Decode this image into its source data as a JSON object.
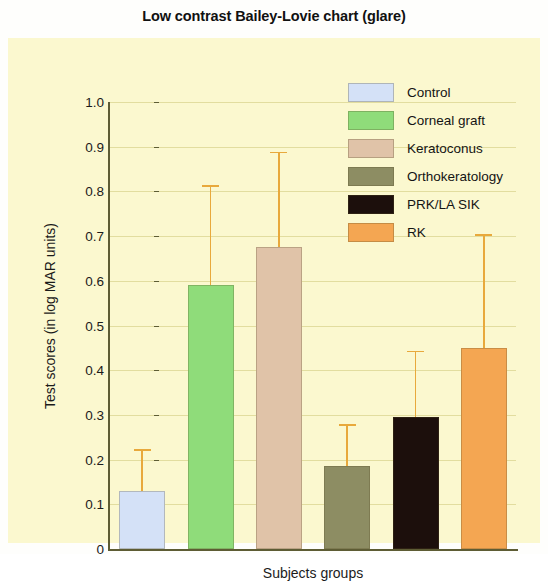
{
  "chart_data": {
    "type": "bar",
    "title": "Low contrast Bailey-Lovie chart (glare)",
    "xlabel": "Subjects groups",
    "ylabel": "Test scores (in log MAR units)",
    "ylim": [
      0,
      1.0
    ],
    "ytick_labels": [
      "1.0",
      "0.9",
      "0.8",
      "0.7",
      "0.6",
      "0.5",
      "0.4",
      "0.3",
      "0.2",
      "0.1",
      "0"
    ],
    "ytick_values": [
      1.0,
      0.9,
      0.8,
      0.7,
      0.6,
      0.5,
      0.4,
      0.3,
      0.2,
      0.1,
      0
    ],
    "grid": true,
    "legend_position": "upper right",
    "categories": [
      "Control",
      "Corneal graft",
      "Keratoconus",
      "Orthokeratology",
      "PRK/LA SIK",
      "RK"
    ],
    "values": [
      0.13,
      0.59,
      0.675,
      0.185,
      0.295,
      0.45
    ],
    "error_upper": [
      0.22,
      0.81,
      0.885,
      0.275,
      0.44,
      0.7
    ],
    "error_bar_color": "#e8a93c",
    "colors": [
      "#d4e1f7",
      "#8fdc7a",
      "#e0c3a8",
      "#8d8d63",
      "#1c0f0c",
      "#f4a652"
    ],
    "plot_background": "#fbf8cf",
    "axis_color": "#5d5c34",
    "bars": [
      {
        "label": "Control",
        "value": 0.13,
        "error_top": 0.22,
        "color": "#d4e1f7",
        "pattern": "solid"
      },
      {
        "label": "Corneal graft",
        "value": 0.59,
        "error_top": 0.81,
        "color": "#8fdc7a",
        "pattern": "solid"
      },
      {
        "label": "Keratoconus",
        "value": 0.675,
        "error_top": 0.885,
        "color": "#e0c3a8",
        "pattern": "hatch"
      },
      {
        "label": "Orthokeratology",
        "value": 0.185,
        "error_top": 0.275,
        "color": "#8d8d63",
        "pattern": "hatch"
      },
      {
        "label": "PRK/LA SIK",
        "value": 0.295,
        "error_top": 0.44,
        "color": "#1c0f0c",
        "pattern": "hatch-dark"
      },
      {
        "label": "RK",
        "value": 0.45,
        "error_top": 0.7,
        "color": "#f4a652",
        "pattern": "speckle"
      }
    ]
  },
  "legend": {
    "items": [
      {
        "label": "Control",
        "color": "#d4e1f7",
        "pattern": "solid"
      },
      {
        "label": "Corneal graft",
        "color": "#8fdc7a",
        "pattern": "solid"
      },
      {
        "label": "Keratoconus",
        "color": "#e0c3a8",
        "pattern": "hatch"
      },
      {
        "label": "Orthokeratology",
        "color": "#8d8d63",
        "pattern": "hatch"
      },
      {
        "label": "PRK/LA SIK",
        "color": "#1c0f0c",
        "pattern": "hatch-dark"
      },
      {
        "label": "RK",
        "color": "#f4a652",
        "pattern": "speckle"
      }
    ]
  }
}
